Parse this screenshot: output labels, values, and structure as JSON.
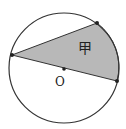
{
  "diagram": {
    "type": "geometry-circle-sector",
    "circle": {
      "cx": 64,
      "cy": 68,
      "r": 55,
      "stroke": "#333333"
    },
    "points": {
      "A": {
        "x": 12,
        "y": 55
      },
      "B": {
        "x": 97,
        "y": 23
      },
      "C": {
        "x": 117,
        "y": 81
      },
      "O": {
        "x": 64,
        "y": 69
      }
    },
    "shaded_region": {
      "label": "甲",
      "fill": "#b8b8b8"
    },
    "labels": {
      "center": "O",
      "region": "甲"
    }
  }
}
